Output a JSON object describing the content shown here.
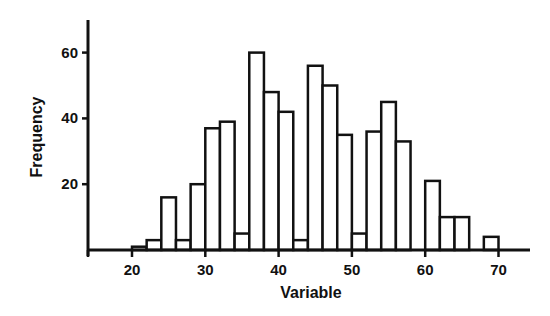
{
  "chart_data": {
    "type": "bar",
    "subtype": "histogram",
    "title": "",
    "xlabel": "Variable",
    "ylabel": "Frequency",
    "bin_width": 2,
    "bin_edges": [
      20,
      22,
      24,
      26,
      28,
      30,
      32,
      34,
      36,
      38,
      40,
      42,
      44,
      46,
      48,
      50,
      52,
      54,
      56,
      58,
      60,
      62,
      64,
      66,
      68,
      70
    ],
    "categories": [
      "20-22",
      "22-24",
      "24-26",
      "26-28",
      "28-30",
      "30-32",
      "32-34",
      "34-36",
      "36-38",
      "38-40",
      "40-42",
      "42-44",
      "44-46",
      "46-48",
      "48-50",
      "50-52",
      "52-54",
      "54-56",
      "56-58",
      "58-60",
      "60-62",
      "62-64",
      "64-66",
      "66-68",
      "68-70"
    ],
    "values": [
      1,
      3,
      16,
      3,
      20,
      37,
      39,
      5,
      60,
      48,
      42,
      3,
      56,
      50,
      35,
      5,
      36,
      45,
      33,
      0,
      21,
      10,
      10,
      0,
      4
    ],
    "xlim": [
      14,
      72
    ],
    "ylim": [
      0,
      70
    ],
    "x_ticks": [
      20,
      30,
      40,
      50,
      60,
      70
    ],
    "y_ticks": [
      20,
      40,
      60
    ],
    "x_tick_labels": [
      "20",
      "30",
      "40",
      "50",
      "60",
      "70"
    ],
    "y_tick_labels": [
      "20",
      "40",
      "60"
    ],
    "grid": false,
    "legend": null,
    "bar_fill": "#ffffff",
    "bar_edge": "#111111"
  }
}
